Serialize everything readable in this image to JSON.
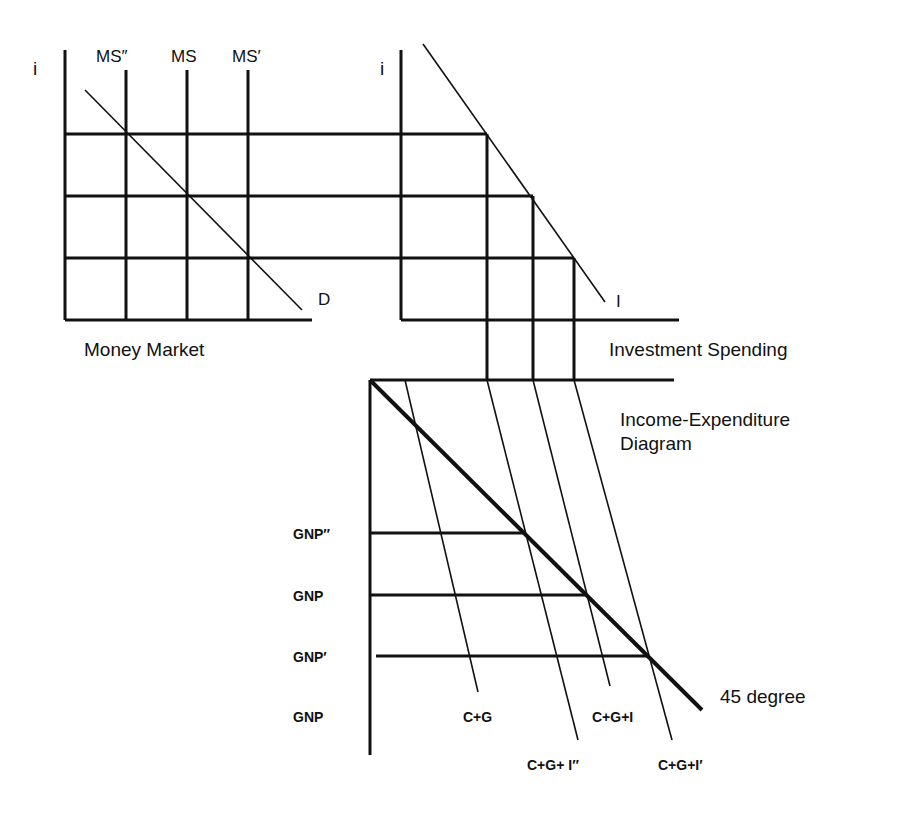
{
  "money_market": {
    "title": "Money Market",
    "y_axis_label": "i",
    "supply_labels": [
      "MS″",
      "MS",
      "MS′"
    ],
    "demand_label": "D"
  },
  "investment": {
    "title": "Investment Spending",
    "y_axis_label": "i",
    "curve_label": "I"
  },
  "income_expenditure": {
    "title_line1": "Income-Expenditure",
    "title_line2": "Diagram",
    "gnp_labels": [
      "GNP″",
      "GNP",
      "GNP′",
      "GNP"
    ],
    "curve_labels": {
      "cg": "C+G",
      "cgi": "C+G+I",
      "cgi_double_prime": "C+G+ I″",
      "cgi_prime": "C+G+I′"
    },
    "reference_line_label": "45 degree"
  },
  "colors": {
    "ink": "#111111",
    "background": "#ffffff"
  }
}
